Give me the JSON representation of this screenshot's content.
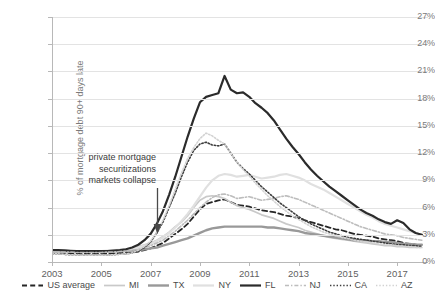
{
  "chart_data": {
    "type": "line",
    "title": "",
    "subtitle": "",
    "xlabel": "",
    "ylabel": "% of mortgage debt 90+ days late",
    "xlim": [
      2003.0,
      2018.25
    ],
    "ylim": [
      0,
      27
    ],
    "grid": true,
    "legend_position": "bottom",
    "x_tick_labels": [
      "2003",
      "2005",
      "2007",
      "2009",
      "2011",
      "2013",
      "2015",
      "2017"
    ],
    "x_tick_values": [
      2003,
      2005,
      2007,
      2009,
      2011,
      2013,
      2015,
      2017
    ],
    "y_tick_labels": [
      "0%",
      "3%",
      "6%",
      "9%",
      "12%",
      "15%",
      "18%",
      "21%",
      "24%",
      "27%"
    ],
    "y_tick_values": [
      0,
      3,
      6,
      9,
      12,
      15,
      18,
      21,
      24,
      27
    ],
    "annotations": [
      {
        "text_line_1": "private mortgage",
        "text_line_2": "securitizations",
        "text_line_3": "markets collapse",
        "marker": "down-arrow",
        "x": 2007.6,
        "y": 2.0
      }
    ],
    "x": [
      2003.0,
      2003.25,
      2003.5,
      2003.75,
      2004.0,
      2004.25,
      2004.5,
      2004.75,
      2005.0,
      2005.25,
      2005.5,
      2005.75,
      2006.0,
      2006.25,
      2006.5,
      2006.75,
      2007.0,
      2007.25,
      2007.5,
      2007.75,
      2008.0,
      2008.25,
      2008.5,
      2008.75,
      2009.0,
      2009.25,
      2009.5,
      2009.75,
      2010.0,
      2010.25,
      2010.5,
      2010.75,
      2011.0,
      2011.25,
      2011.5,
      2011.75,
      2012.0,
      2012.25,
      2012.5,
      2012.75,
      2013.0,
      2013.25,
      2013.5,
      2013.75,
      2014.0,
      2014.25,
      2014.5,
      2014.75,
      2015.0,
      2015.25,
      2015.5,
      2015.75,
      2016.0,
      2016.25,
      2016.5,
      2016.75,
      2017.0,
      2017.25,
      2017.5,
      2017.75,
      2018.0
    ],
    "series": [
      {
        "name": "US average",
        "style": "dashed",
        "color": "#262626",
        "width": 1.8,
        "values": [
          1.0,
          1.0,
          1.0,
          0.95,
          0.95,
          0.95,
          0.95,
          0.95,
          0.95,
          0.95,
          0.95,
          1.0,
          1.0,
          1.05,
          1.15,
          1.3,
          1.5,
          1.8,
          2.1,
          2.6,
          3.1,
          3.6,
          4.2,
          5.0,
          5.8,
          6.4,
          6.6,
          6.8,
          6.9,
          6.6,
          6.3,
          6.2,
          6.1,
          5.9,
          5.7,
          5.6,
          5.5,
          5.3,
          5.1,
          5.0,
          4.8,
          4.6,
          4.4,
          4.2,
          4.0,
          3.8,
          3.6,
          3.5,
          3.3,
          3.1,
          3.0,
          2.9,
          2.8,
          2.6,
          2.5,
          2.4,
          2.3,
          2.1,
          2.0,
          1.9,
          1.8
        ]
      },
      {
        "name": "MI",
        "style": "solid",
        "color": "#c9c9c9",
        "width": 1.7,
        "values": [
          1.1,
          1.1,
          1.1,
          1.1,
          1.1,
          1.1,
          1.1,
          1.15,
          1.2,
          1.2,
          1.25,
          1.3,
          1.4,
          1.5,
          1.7,
          1.9,
          2.1,
          2.4,
          2.8,
          3.3,
          3.9,
          4.4,
          5.1,
          6.0,
          6.8,
          7.2,
          7.3,
          7.2,
          7.0,
          6.6,
          6.2,
          6.0,
          5.8,
          5.5,
          5.2,
          5.0,
          4.8,
          4.5,
          4.2,
          4.0,
          3.8,
          3.5,
          3.3,
          3.1,
          2.9,
          2.7,
          2.6,
          2.5,
          2.4,
          2.3,
          2.2,
          2.1,
          2.0,
          1.9,
          1.8,
          1.8,
          1.7,
          1.7,
          1.6,
          1.6,
          1.6
        ]
      },
      {
        "name": "TX",
        "style": "solid",
        "color": "#999999",
        "width": 2.4,
        "values": [
          1.3,
          1.3,
          1.3,
          1.25,
          1.2,
          1.2,
          1.2,
          1.2,
          1.2,
          1.2,
          1.2,
          1.2,
          1.2,
          1.25,
          1.3,
          1.4,
          1.5,
          1.6,
          1.8,
          2.0,
          2.2,
          2.4,
          2.6,
          2.9,
          3.2,
          3.5,
          3.7,
          3.8,
          3.9,
          3.9,
          3.9,
          3.9,
          3.9,
          3.9,
          3.9,
          3.8,
          3.8,
          3.7,
          3.6,
          3.5,
          3.4,
          3.2,
          3.1,
          3.0,
          2.9,
          2.8,
          2.7,
          2.6,
          2.5,
          2.4,
          2.4,
          2.4,
          2.3,
          2.3,
          2.2,
          2.2,
          2.1,
          2.0,
          2.0,
          1.9,
          1.9
        ]
      },
      {
        "name": "NY",
        "style": "solid",
        "color": "#e0e0e0",
        "width": 2.2,
        "values": [
          1.2,
          1.2,
          1.2,
          1.2,
          1.2,
          1.2,
          1.2,
          1.2,
          1.2,
          1.25,
          1.3,
          1.35,
          1.4,
          1.5,
          1.6,
          1.8,
          2.0,
          2.3,
          2.7,
          3.2,
          3.8,
          4.5,
          5.3,
          6.2,
          7.2,
          8.2,
          9.0,
          9.5,
          9.7,
          9.6,
          9.4,
          9.5,
          9.6,
          9.4,
          9.2,
          9.3,
          9.4,
          9.6,
          9.7,
          9.5,
          9.3,
          9.0,
          8.6,
          8.3,
          8.0,
          7.6,
          7.2,
          6.8,
          6.4,
          6.0,
          5.6,
          5.2,
          4.9,
          4.5,
          4.2,
          4.0,
          3.8,
          3.6,
          3.4,
          3.2,
          3.0
        ]
      },
      {
        "name": "FL",
        "style": "solid",
        "color": "#2b2b2b",
        "width": 2.2,
        "values": [
          1.3,
          1.3,
          1.25,
          1.2,
          1.2,
          1.2,
          1.2,
          1.2,
          1.2,
          1.2,
          1.25,
          1.3,
          1.4,
          1.6,
          1.9,
          2.4,
          3.1,
          4.2,
          5.6,
          7.4,
          9.4,
          11.6,
          13.8,
          15.8,
          17.6,
          18.2,
          18.4,
          18.6,
          20.5,
          19.0,
          18.6,
          18.7,
          18.2,
          17.5,
          17.0,
          16.4,
          15.6,
          14.6,
          13.6,
          12.7,
          11.9,
          11.0,
          10.2,
          9.5,
          8.9,
          8.3,
          7.8,
          7.3,
          6.8,
          6.3,
          5.8,
          5.4,
          5.1,
          4.7,
          4.4,
          4.2,
          4.6,
          4.3,
          3.6,
          3.2,
          3.0
        ]
      },
      {
        "name": "NJ",
        "style": "dashdot",
        "color": "#bdbdbd",
        "width": 1.6,
        "values": [
          1.1,
          1.1,
          1.1,
          1.1,
          1.05,
          1.05,
          1.05,
          1.05,
          1.05,
          1.1,
          1.1,
          1.15,
          1.2,
          1.3,
          1.4,
          1.6,
          1.8,
          2.1,
          2.4,
          2.9,
          3.4,
          4.0,
          4.6,
          5.3,
          6.0,
          6.6,
          7.1,
          7.4,
          7.5,
          7.3,
          7.0,
          7.1,
          7.2,
          7.0,
          6.8,
          6.9,
          7.0,
          7.2,
          7.3,
          7.1,
          6.9,
          6.6,
          6.3,
          6.0,
          5.7,
          5.4,
          5.1,
          4.8,
          4.5,
          4.2,
          3.9,
          3.7,
          3.5,
          3.3,
          3.1,
          3.0,
          2.9,
          2.7,
          2.6,
          2.5,
          2.4
        ]
      },
      {
        "name": "CA",
        "style": "dotted",
        "color": "#3d3d3d",
        "width": 1.6,
        "values": [
          0.9,
          0.9,
          0.85,
          0.8,
          0.8,
          0.75,
          0.75,
          0.75,
          0.75,
          0.75,
          0.8,
          0.85,
          0.9,
          1.0,
          1.2,
          1.6,
          2.2,
          3.2,
          4.4,
          6.0,
          7.6,
          9.4,
          11.0,
          12.3,
          13.0,
          13.2,
          12.9,
          12.8,
          13.0,
          12.0,
          11.0,
          10.3,
          9.7,
          9.0,
          8.3,
          7.7,
          7.1,
          6.5,
          6.0,
          5.5,
          5.0,
          4.6,
          4.2,
          3.9,
          3.6,
          3.3,
          3.1,
          2.9,
          2.7,
          2.6,
          2.5,
          2.4,
          2.3,
          2.2,
          2.1,
          2.0,
          1.9,
          1.9,
          1.8,
          1.8,
          1.7
        ]
      },
      {
        "name": "AZ",
        "style": "dotted",
        "color": "#d2d2d2",
        "width": 1.6,
        "values": [
          0.9,
          0.9,
          0.85,
          0.8,
          0.8,
          0.75,
          0.75,
          0.75,
          0.75,
          0.75,
          0.8,
          0.85,
          0.9,
          1.0,
          1.3,
          1.7,
          2.3,
          3.3,
          4.6,
          6.2,
          8.0,
          9.8,
          11.4,
          12.6,
          13.6,
          14.2,
          13.9,
          13.4,
          13.0,
          12.0,
          11.0,
          10.2,
          9.5,
          8.7,
          8.0,
          7.3,
          6.7,
          6.1,
          5.6,
          5.1,
          4.7,
          4.3,
          3.9,
          3.6,
          3.3,
          3.1,
          2.9,
          2.7,
          2.6,
          2.4,
          2.3,
          2.2,
          2.1,
          2.0,
          1.9,
          1.9,
          1.8,
          1.7,
          1.7,
          1.6,
          1.6
        ]
      }
    ]
  },
  "axis": {
    "y_title": "% of mortgage debt 90+ days late"
  },
  "annotation": {
    "line1": "private mortgage",
    "line2": "securitizations",
    "line3": "markets collapse",
    "arrow_name": "down-arrow-icon"
  },
  "colors": {
    "grid": "#e3e3e3",
    "axis": "#b8b8b8",
    "text": "#6b6b6b"
  }
}
